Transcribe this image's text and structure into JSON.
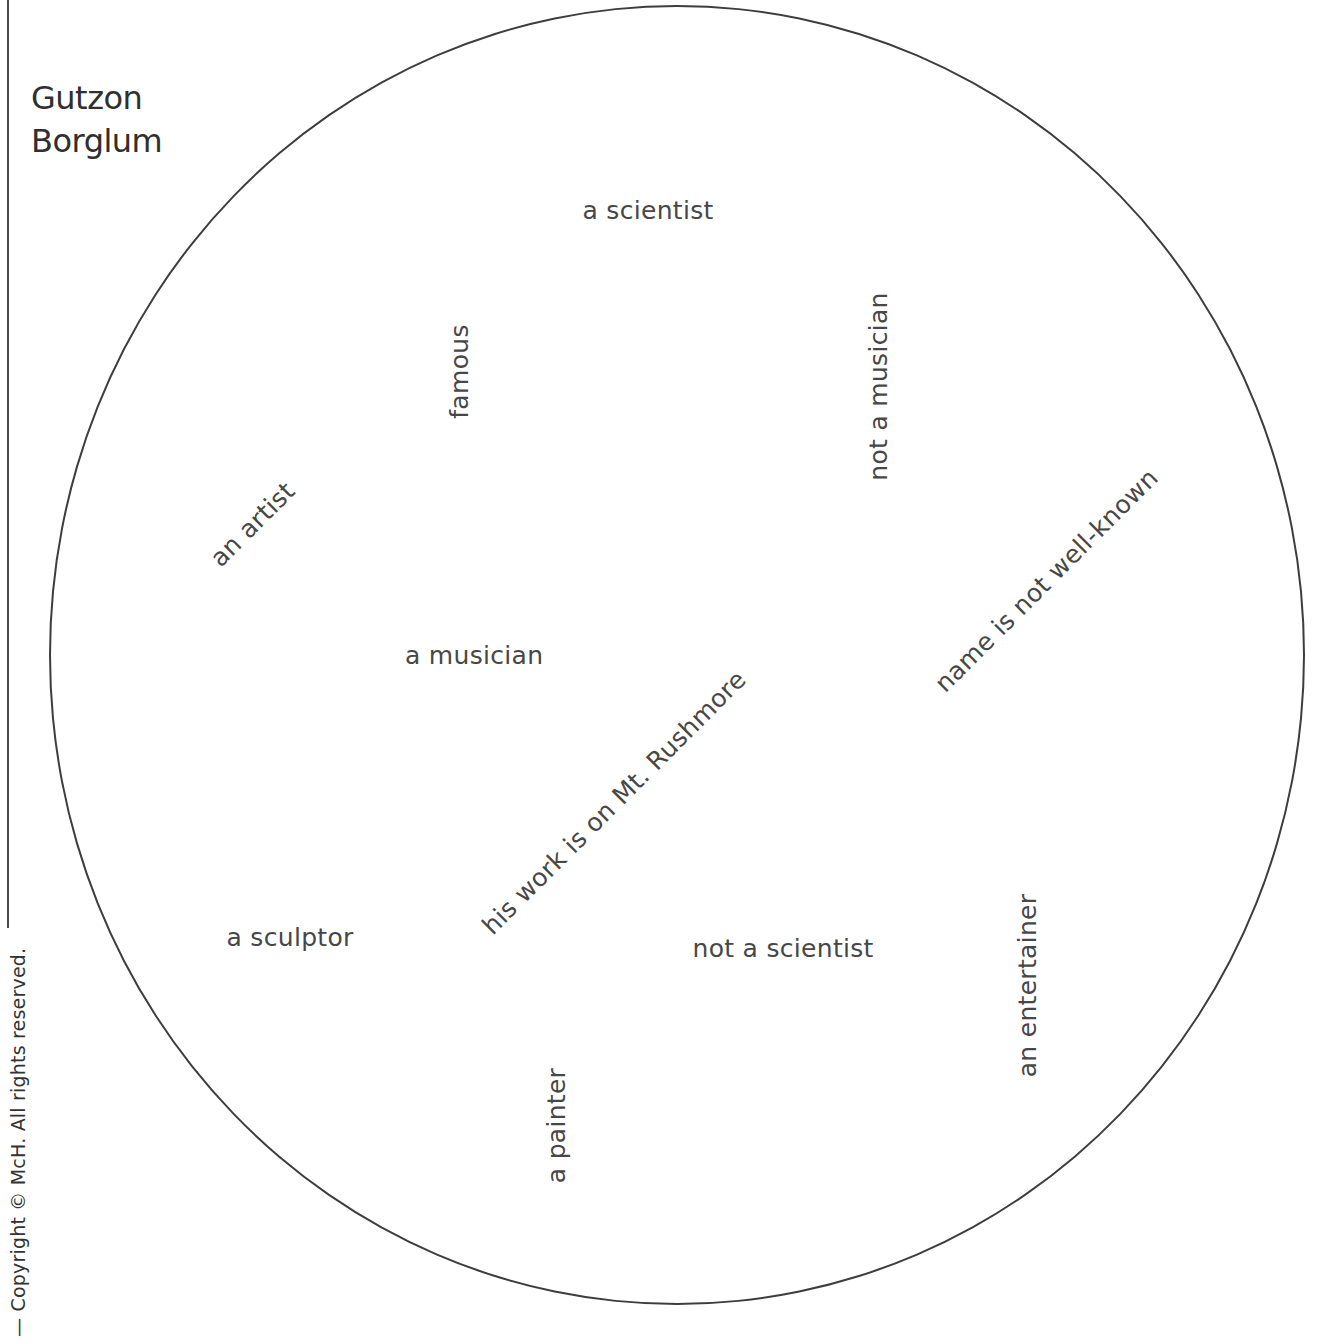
{
  "page": {
    "copyright": "— Copyright © McH. All rights reserved.",
    "title_lines": [
      "Gutzon",
      "Borglum"
    ]
  },
  "words": [
    {
      "id": "a-scientist",
      "text": "a scientist",
      "cx": 648,
      "cy": 210,
      "rotate": 0
    },
    {
      "id": "famous",
      "text": "famous",
      "cx": 459,
      "cy": 371,
      "rotate": -90
    },
    {
      "id": "not-a-musician",
      "text": "not a musician",
      "cx": 878,
      "cy": 386,
      "rotate": -90
    },
    {
      "id": "an-artist",
      "text": "an artist",
      "cx": 252,
      "cy": 524,
      "rotate": -45
    },
    {
      "id": "name-is-not-well-known",
      "text": "name is not well-known",
      "cx": 1046,
      "cy": 580,
      "rotate": -45
    },
    {
      "id": "a-musician",
      "text": "a musician",
      "cx": 474,
      "cy": 655,
      "rotate": 0
    },
    {
      "id": "his-work-is-on-mt-rushmore",
      "text": "his work is on Mt. Rushmore",
      "cx": 614,
      "cy": 802,
      "rotate": -45
    },
    {
      "id": "a-sculptor",
      "text": "a sculptor",
      "cx": 290,
      "cy": 937,
      "rotate": 0
    },
    {
      "id": "not-a-scientist",
      "text": "not a scientist",
      "cx": 783,
      "cy": 948,
      "rotate": 0
    },
    {
      "id": "an-entertainer",
      "text": "an entertainer",
      "cx": 1028,
      "cy": 985,
      "rotate": -90
    },
    {
      "id": "a-painter",
      "text": "a painter",
      "cx": 556,
      "cy": 1125,
      "rotate": -90
    }
  ]
}
